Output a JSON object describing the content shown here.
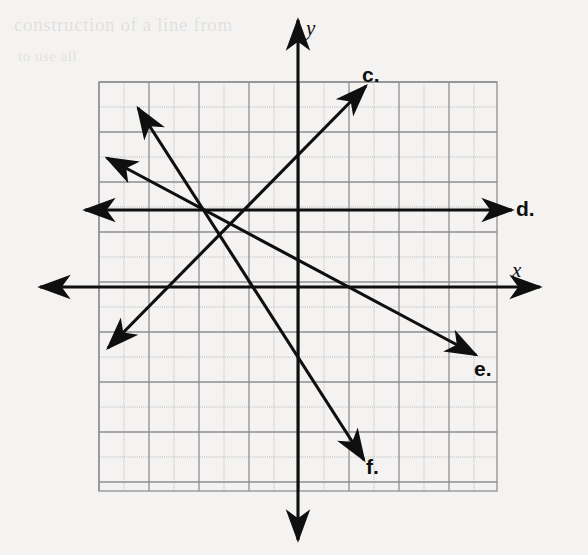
{
  "figure": {
    "background_color": "#f4f3f1",
    "ink_color": "#100f0f",
    "grid_major_color": "#8f8f93",
    "grid_minor_color": "#b9b9bd"
  },
  "bleed_through": {
    "line1": "construction of a line from",
    "line2": "to use all"
  },
  "axes": {
    "x_label": "x",
    "y_label": "y",
    "x_axis": {
      "y": 287,
      "x_start": 40,
      "x_end": 540
    },
    "y_axis": {
      "x": 298,
      "y_start": 20,
      "y_end": 540
    }
  },
  "grid": {
    "left": 99,
    "top": 82,
    "right": 497,
    "bottom": 491,
    "cell_size": 25,
    "cols": 16,
    "rows": 16,
    "major_every": 2
  },
  "lines": [
    {
      "id": "c",
      "label": "c.",
      "label_x": 362,
      "label_y": 63,
      "x1": 108,
      "y1": 348,
      "x2": 366,
      "y2": 86,
      "arrow_start": true,
      "arrow_end": true,
      "slope_description": "positive, rising to the right"
    },
    {
      "id": "d",
      "label": "d.",
      "label_x": 516,
      "label_y": 197,
      "x1": 85,
      "y1": 210,
      "x2": 512,
      "y2": 210,
      "arrow_start": true,
      "arrow_end": true,
      "slope_description": "horizontal, above the x-axis"
    },
    {
      "id": "e",
      "label": "e.",
      "label_x": 474,
      "label_y": 357,
      "x1": 107,
      "y1": 158,
      "x2": 476,
      "y2": 355,
      "arrow_start": true,
      "arrow_end": true,
      "slope_description": "negative, shallow downward to the right"
    },
    {
      "id": "f",
      "label": "f.",
      "label_x": 366,
      "label_y": 455,
      "x1": 138,
      "y1": 108,
      "x2": 364,
      "y2": 460,
      "arrow_start": true,
      "arrow_end": true,
      "slope_description": "negative, steep downward to the right"
    }
  ],
  "chart_data": {
    "type": "line",
    "xlabel": "x",
    "ylabel": "y",
    "grid": true,
    "legend": "inline end-of-line labels",
    "xlim": [
      -8,
      8
    ],
    "ylim": [
      -8,
      8
    ],
    "origin_px": [
      298,
      287
    ],
    "unit_px": 25,
    "series": [
      {
        "name": "c.",
        "points_px": [
          [
            108,
            348
          ],
          [
            366,
            86
          ]
        ],
        "points_units": [
          [
            -7.6,
            -2.44
          ],
          [
            2.72,
            8.04
          ]
        ],
        "slope_units": 1.02,
        "intercept_units": 0.04,
        "direction": "both"
      },
      {
        "name": "d.",
        "points_px": [
          [
            85,
            210
          ],
          [
            512,
            210
          ]
        ],
        "points_units": [
          [
            -8.52,
            3.08
          ],
          [
            8.56,
            3.08
          ]
        ],
        "slope_units": 0,
        "intercept_units": 3.08,
        "direction": "both"
      },
      {
        "name": "e.",
        "points_px": [
          [
            107,
            158
          ],
          [
            476,
            355
          ]
        ],
        "points_units": [
          [
            -7.64,
            5.16
          ],
          [
            7.12,
            -2.72
          ]
        ],
        "slope_units": -0.53,
        "intercept_units": 1.08,
        "direction": "both"
      },
      {
        "name": "f.",
        "points_px": [
          [
            138,
            108
          ],
          [
            364,
            460
          ]
        ],
        "points_units": [
          [
            -6.4,
            7.16
          ],
          [
            2.64,
            -6.92
          ]
        ],
        "slope_units": -1.56,
        "intercept_units": -2.84,
        "direction": "both"
      }
    ]
  }
}
